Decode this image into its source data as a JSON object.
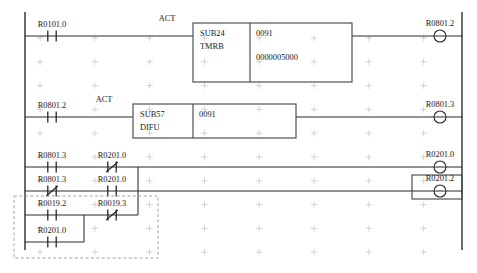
{
  "diagram": {
    "kind": "ladder-logic",
    "colors": {
      "wire": "#2b2b2b",
      "rail": "#3a3a3a",
      "box": "#4a4a4a",
      "grid": "#c9c9c9",
      "selection": "#9a9a9a",
      "text": "#1a1a1a",
      "background": "#ffffff"
    }
  },
  "grid": {
    "origin_x": 40,
    "origin_y": 38,
    "step_x": 54.8,
    "step_y": 23.8,
    "cols": 8,
    "rows": 10,
    "mark_size": 3.2
  },
  "rails": {
    "left_x": 25,
    "right_x": 462,
    "top_y": 12,
    "bottom_y": 250
  },
  "rungs": [
    {
      "id": "rung-1",
      "y": 36,
      "contacts": [
        {
          "name": "R0101.0",
          "type": "no",
          "x": 52,
          "label_dy": -9
        }
      ],
      "annotations": [
        {
          "text": "ACT",
          "x": 167,
          "y": 21
        }
      ],
      "block": {
        "id": "block-sub24-tmrb",
        "x": 193,
        "y": 23,
        "w": 159,
        "h": 59,
        "divider_x": 250,
        "left_lines": [
          "SUB24",
          "TMRB"
        ],
        "right_lines": [
          "0091",
          "0000005000"
        ]
      },
      "coils": [
        {
          "name": "R0801.2",
          "x": 440,
          "y": 36,
          "label_dy": -10
        }
      ]
    },
    {
      "id": "rung-2",
      "y": 117,
      "contacts": [
        {
          "name": "R0801.2",
          "type": "no",
          "x": 52,
          "label_dy": -9
        }
      ],
      "annotations": [
        {
          "text": "ACT",
          "x": 104,
          "y": 102
        }
      ],
      "block": {
        "id": "block-sub57-difu",
        "x": 133,
        "y": 104,
        "w": 163,
        "h": 34,
        "divider_x": 193,
        "left_lines": [
          "SUB57",
          "DIFU"
        ],
        "right_lines": [
          "0091"
        ]
      },
      "coils": [
        {
          "name": "R0801.3",
          "x": 440,
          "y": 117,
          "label_dy": -10
        }
      ]
    },
    {
      "id": "rung-3",
      "y": 167,
      "branch_join_x": 138,
      "branches": [
        {
          "id": "branch-a",
          "y": 167,
          "contacts": [
            {
              "name": "R0801.3",
              "type": "no",
              "x": 52,
              "label_dy": -9
            },
            {
              "name": "R0201.0",
              "type": "nc",
              "x": 112,
              "label_dy": -9
            }
          ]
        },
        {
          "id": "branch-b",
          "y": 191,
          "contacts": [
            {
              "name": "R0801.3",
              "type": "nc",
              "x": 52,
              "label_dy": -9
            },
            {
              "name": "R0201.0",
              "type": "no",
              "x": 112,
              "label_dy": -9
            }
          ]
        },
        {
          "id": "branch-c",
          "y": 215,
          "contacts": [
            {
              "name": "R0019.2",
              "type": "no",
              "x": 52,
              "label_dy": -9
            },
            {
              "name": "R0019.3",
              "type": "nc",
              "x": 112,
              "label_dy": -9
            }
          ]
        },
        {
          "id": "branch-d",
          "y": 242,
          "sub_join_x": 84,
          "contacts": [
            {
              "name": "R0201.0",
              "type": "no",
              "x": 52,
              "label_dy": -9
            }
          ]
        }
      ],
      "coils": [
        {
          "name": "R0201.0",
          "x": 440,
          "y": 167,
          "label_dy": -10
        },
        {
          "name": "R0201.2",
          "x": 440,
          "y": 191,
          "label_dy": -10
        }
      ],
      "coil_box": {
        "x": 412,
        "y": 175,
        "w": 50,
        "h": 24
      }
    }
  ],
  "selection_box": {
    "id": "selection-region",
    "x": 14,
    "y": 196,
    "w": 144,
    "h": 62
  }
}
